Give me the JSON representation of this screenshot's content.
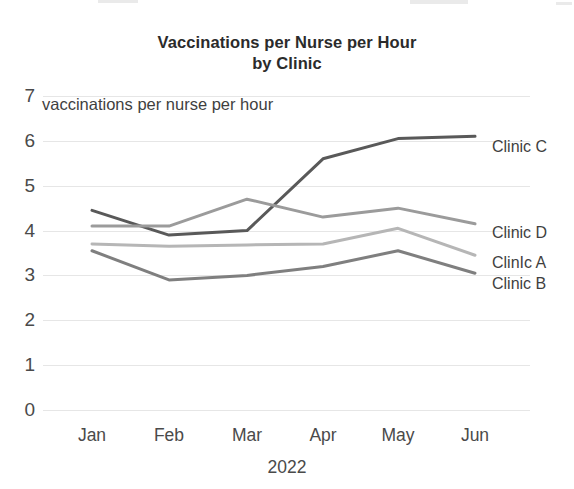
{
  "chart_data": {
    "type": "line",
    "title": "Vaccinations per Nurse per Hour by Clinic",
    "title_line1": "Vaccinations per Nurse per Hour",
    "title_line2": "by Clinic",
    "ylabel": "vaccinations per nurse per hour",
    "xlabel": "2022",
    "categories": [
      "Jan",
      "Feb",
      "Mar",
      "Apr",
      "May",
      "Jun"
    ],
    "ylim": [
      0,
      7
    ],
    "yticks": [
      0,
      1,
      2,
      3,
      4,
      5,
      6,
      7
    ],
    "grid": true,
    "legend_position": "right-of-line-ends",
    "series": [
      {
        "name": "Clinic C",
        "color": "#595959",
        "values": [
          4.45,
          3.9,
          4.0,
          5.6,
          6.05,
          6.1
        ]
      },
      {
        "name": "Clinic D",
        "color": "#9b9b9b",
        "values": [
          4.1,
          4.1,
          4.7,
          4.3,
          4.5,
          4.15
        ]
      },
      {
        "name": "Clinic A",
        "color": "#b6b6b6",
        "values": [
          3.7,
          3.65,
          3.68,
          3.7,
          4.05,
          3.45
        ]
      },
      {
        "name": "Clinic B",
        "color": "#7f7f7f",
        "values": [
          3.55,
          2.9,
          3.0,
          3.2,
          3.55,
          3.05
        ]
      }
    ]
  },
  "axis": {
    "y_tick_labels": [
      "7",
      "6",
      "5",
      "4",
      "3",
      "2",
      "1",
      "0"
    ],
    "x_tick_labels": [
      "Jan",
      "Feb",
      "Mar",
      "Apr",
      "May",
      "Jun"
    ],
    "x_title": "2022",
    "y_caption": "vaccinations per nurse per hour"
  },
  "legend": {
    "items": [
      {
        "label": "Clinic C"
      },
      {
        "label": "Clinic D"
      },
      {
        "label": "ClinIc A"
      },
      {
        "label": "Clinic B"
      }
    ]
  }
}
